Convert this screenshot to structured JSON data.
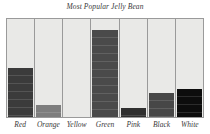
{
  "chart_data": {
    "type": "bar",
    "title": "Most Popular Jelly Bean",
    "xlabel": "",
    "ylabel": "",
    "ylim": [
      0,
      100
    ],
    "grid": false,
    "legend": false,
    "categories": [
      "Red",
      "Orange",
      "Yellow",
      "Green",
      "Pink",
      "Black",
      "White"
    ],
    "values": [
      50,
      12,
      0,
      89,
      9,
      25,
      29
    ],
    "bars": [
      {
        "label": "Red",
        "value": 50,
        "fill": "#3b3b3b"
      },
      {
        "label": "Orange",
        "value": 12,
        "fill": "#7d7d7d"
      },
      {
        "label": "Yellow",
        "value": 0,
        "fill": "#d7d7d3"
      },
      {
        "label": "Green",
        "value": 89,
        "fill": "#4a4a4a"
      },
      {
        "label": "Pink",
        "value": 9,
        "fill": "#2f2f2f"
      },
      {
        "label": "Black",
        "value": 25,
        "fill": "#474747"
      },
      {
        "label": "White",
        "value": 29,
        "fill": "#0d0d0d"
      }
    ]
  },
  "colors": {
    "page_background": "#ffffff",
    "plot_background": "#e9e9e7",
    "frame": "#9a9a9a",
    "text": "#3a3a3a"
  }
}
